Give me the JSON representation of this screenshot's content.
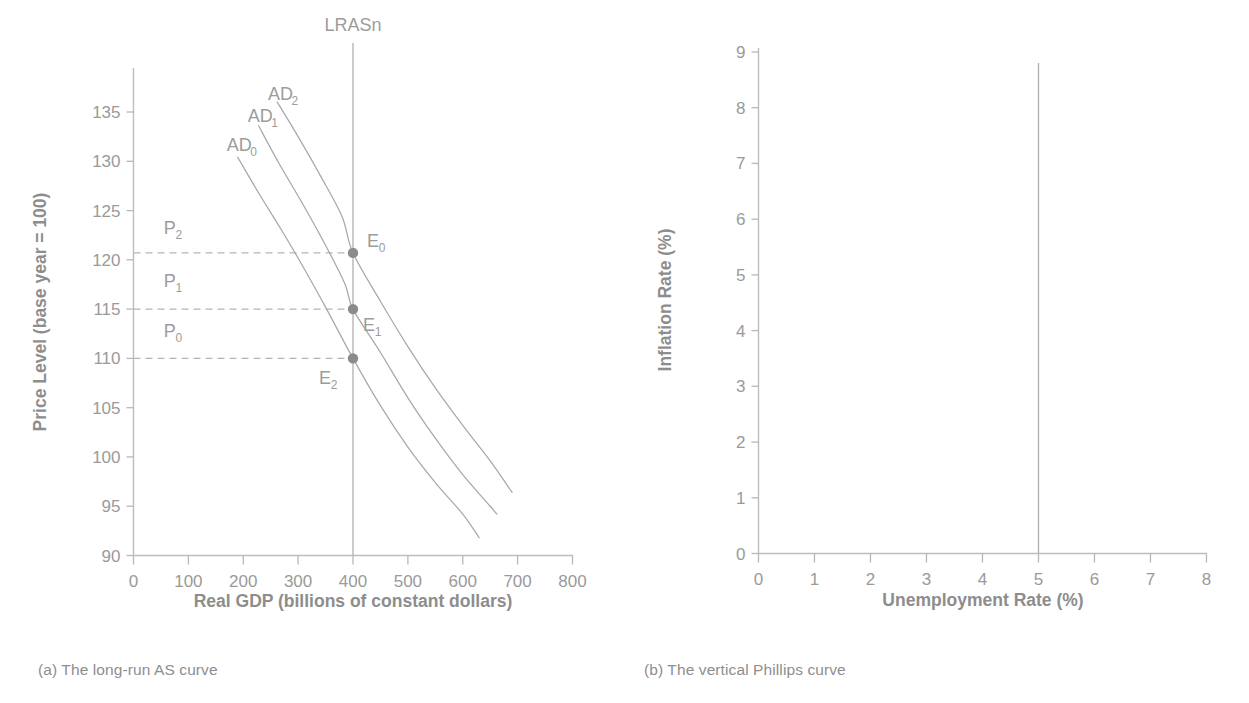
{
  "figure": {
    "panels": [
      {
        "id": "a",
        "caption": "(a) The long-run AS curve"
      },
      {
        "id": "b",
        "caption": "(b) The vertical Phillips curve"
      }
    ]
  },
  "chart_data": [
    {
      "type": "line",
      "panel": "a",
      "title": "",
      "xlabel": "Real GDP (billions of constant dollars)",
      "ylabel": "Price Level (base year = 100)",
      "xlim": [
        0,
        800
      ],
      "ylim": [
        90,
        140
      ],
      "xticks": [
        0,
        100,
        200,
        300,
        400,
        500,
        600,
        700,
        800
      ],
      "xtick_labels": [
        "0",
        "100",
        "200",
        "300",
        "400",
        "500",
        "600",
        "700",
        "800"
      ],
      "yticks": [
        90,
        95,
        100,
        105,
        110,
        115,
        120,
        125,
        130,
        135
      ],
      "ytick_labels": [
        "90",
        "95",
        "100",
        "105",
        "110",
        "115",
        "120",
        "125",
        "130",
        "135"
      ],
      "grid": false,
      "legend_position": "none",
      "series": [
        {
          "name": "AD_0",
          "label": "AD",
          "label_sub": "0",
          "label_x": 170,
          "label_y": 131.0,
          "points": [
            [
              190,
              130.4
            ],
            [
              230,
              126.6
            ],
            [
              270,
              123.0
            ],
            [
              310,
              119.2
            ],
            [
              350,
              115.2
            ],
            [
              400,
              110.0
            ],
            [
              450,
              105.2
            ],
            [
              500,
              101.0
            ],
            [
              550,
              97.4
            ],
            [
              600,
              94.2
            ],
            [
              630,
              91.8
            ]
          ]
        },
        {
          "name": "AD_1",
          "label": "AD",
          "label_sub": "1",
          "label_x": 208,
          "label_y": 134.0,
          "points": [
            [
              228,
              133.6
            ],
            [
              265,
              129.8
            ],
            [
              305,
              126.0
            ],
            [
              345,
              122.0
            ],
            [
              385,
              117.6
            ],
            [
              400,
              115.0
            ],
            [
              450,
              110.6
            ],
            [
              500,
              106.0
            ],
            [
              550,
              101.9
            ],
            [
              600,
              98.2
            ],
            [
              650,
              95.0
            ],
            [
              662,
              94.2
            ]
          ]
        },
        {
          "name": "AD_2",
          "label": "AD",
          "label_sub": "2",
          "label_x": 245,
          "label_y": 136.2,
          "points": [
            [
              262,
              136.0
            ],
            [
              300,
              132.5
            ],
            [
              340,
              128.6
            ],
            [
              380,
              124.4
            ],
            [
              400,
              120.7
            ],
            [
              450,
              115.8
            ],
            [
              500,
              111.2
            ],
            [
              550,
              107.0
            ],
            [
              600,
              103.2
            ],
            [
              650,
              99.6
            ],
            [
              690,
              96.4
            ]
          ]
        }
      ],
      "vertical_lines": [
        {
          "name": "LRASn",
          "label": "LRASn",
          "x": 400,
          "y_top": 142.0,
          "y_bottom": 90.0
        }
      ],
      "markers": [
        {
          "name": "E_0",
          "label": "E",
          "label_sub": "0",
          "x": 400,
          "y": 120.7
        },
        {
          "name": "E_1",
          "label": "E",
          "label_sub": "1",
          "x": 400,
          "y": 115.0
        },
        {
          "name": "E_2",
          "label": "E",
          "label_sub": "2",
          "x": 400,
          "y": 110.0
        }
      ],
      "annotations": [
        {
          "name": "P_2",
          "label": "P",
          "label_sub": "2",
          "x": 55,
          "y": 122.6,
          "dashed_at": 120.7
        },
        {
          "name": "P_1",
          "label": "P",
          "label_sub": "1",
          "x": 55,
          "y": 117.2,
          "dashed_at": 115.0
        },
        {
          "name": "P_0",
          "label": "P",
          "label_sub": "0",
          "x": 55,
          "y": 112.2,
          "dashed_at": 110.0
        }
      ]
    },
    {
      "type": "line",
      "panel": "b",
      "title": "",
      "xlabel": "Unemployment Rate (%)",
      "ylabel": "Inflation Rate (%)",
      "xlim": [
        0,
        8
      ],
      "ylim": [
        0,
        9
      ],
      "xticks": [
        0,
        1,
        2,
        3,
        4,
        5,
        6,
        7,
        8
      ],
      "xtick_labels": [
        "0",
        "1",
        "2",
        "3",
        "4",
        "5",
        "6",
        "7",
        "8"
      ],
      "yticks": [
        0,
        1,
        2,
        3,
        4,
        5,
        6,
        7,
        8,
        9
      ],
      "ytick_labels": [
        "0",
        "1",
        "2",
        "3",
        "4",
        "5",
        "6",
        "7",
        "8",
        "9"
      ],
      "grid": false,
      "legend_position": "none",
      "series": [],
      "vertical_lines": [
        {
          "name": "vertical-phillips-curve",
          "label": "",
          "x": 5,
          "y_top": 8.8,
          "y_bottom": 0
        }
      ],
      "markers": [],
      "annotations": []
    }
  ],
  "colors": {
    "axis": "#b8b8b8",
    "curve": "#a8a8a8",
    "marker": "#8b8b8b",
    "dashed": "#b5b5b5",
    "text": "#959595",
    "caption": "#8e8e8e",
    "background": "#ffffff"
  }
}
